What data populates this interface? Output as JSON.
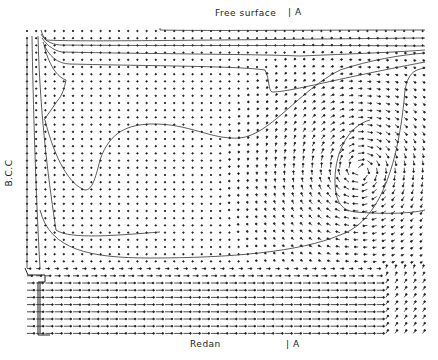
{
  "figure": {
    "type": "velocity vector field with streamlines",
    "labels": {
      "top": "Free surface",
      "top_marker": "| A",
      "bottom": "Redan",
      "bottom_marker": "| A",
      "left": "B.C.C"
    },
    "caption": "",
    "colors": {
      "background": "#ffffff",
      "ink": "#1a1a1a"
    },
    "domain_box": {
      "x0": 25,
      "y0": 27,
      "x1": 425,
      "y1": 336
    }
  }
}
